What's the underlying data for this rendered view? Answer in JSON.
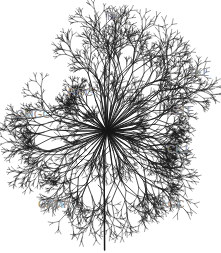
{
  "figure": {
    "kind": "kinome-phylogenetic-tree",
    "background_color": "#ffffff",
    "branch_color": "#171717",
    "label_color": "#8d8d8d",
    "width": 221,
    "height": 253
  },
  "tree": {
    "center_x": 107,
    "center_y": 131,
    "trunk": {
      "x": 104,
      "y_top": 150,
      "y_bottom": 250
    },
    "groups": [
      {
        "id": "tk",
        "label": "TK",
        "label_x": 105,
        "label_y": 11,
        "angle_start": -115,
        "angle_end": -62,
        "radius": 112,
        "branch_count": 7
      },
      {
        "id": "tkl",
        "label": "TKL",
        "label_x": 188,
        "label_y": 67,
        "angle_start": -62,
        "angle_end": -22,
        "radius": 106,
        "branch_count": 5
      },
      {
        "id": "ste",
        "label": "STE",
        "label_x": 172,
        "label_y": 105,
        "angle_start": -22,
        "angle_end": 8,
        "radius": 88,
        "branch_count": 5
      },
      {
        "id": "ck1",
        "label": "CK1",
        "label_x": 167,
        "label_y": 144,
        "angle_start": 8,
        "angle_end": 33,
        "radius": 78,
        "branch_count": 4
      },
      {
        "id": "agc",
        "label": "AGC",
        "label_x": 160,
        "label_y": 199,
        "angle_start": 33,
        "angle_end": 82,
        "radius": 96,
        "branch_count": 6
      },
      {
        "id": "camk",
        "label": "CAMK",
        "label_x": 38,
        "label_y": 199,
        "angle_start": 95,
        "angle_end": 150,
        "radius": 98,
        "branch_count": 6
      },
      {
        "id": "cmgc",
        "label": "CMGC",
        "label_x": 16,
        "label_y": 109,
        "angle_start": 150,
        "angle_end": 205,
        "radius": 94,
        "branch_count": 6
      },
      {
        "id": "rgc",
        "label": "RGC",
        "label_x": 68,
        "label_y": 87,
        "angle_start": 205,
        "angle_end": 238,
        "radius": 62,
        "branch_count": 4
      }
    ]
  }
}
